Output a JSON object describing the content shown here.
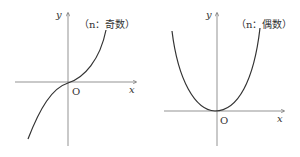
{
  "graphs": [
    {
      "id": "odd",
      "label": "（n：奇数）",
      "label_n": "n",
      "label_kind": "奇数",
      "x_axis": "x",
      "y_axis": "y",
      "origin": "O",
      "curve": "cubic-like (y = x^n, n odd)"
    },
    {
      "id": "even",
      "label": "（n：偶数）",
      "label_n": "n",
      "label_kind": "偶数",
      "x_axis": "x",
      "y_axis": "y",
      "origin": "O",
      "curve": "parabola-like (y = x^n, n even)"
    }
  ],
  "colors": {
    "stroke": "#333333",
    "axis": "#555555"
  }
}
